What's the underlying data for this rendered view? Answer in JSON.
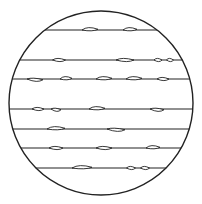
{
  "diagram": {
    "title": "",
    "colors": {
      "stroke": "#222222",
      "background": "#ffffff"
    },
    "circle": {
      "cx": 101,
      "cy": 103,
      "r": 92
    },
    "fibers": [
      {
        "y": 30,
        "nodes": [
          {
            "x": 90,
            "w": 16,
            "tilt": 1
          },
          {
            "x": 130,
            "w": 14,
            "tilt": 1
          }
        ]
      },
      {
        "y": 60,
        "nodes": [
          {
            "x": 59,
            "w": 13,
            "tilt": 0
          },
          {
            "x": 125,
            "w": 18,
            "tilt": 0
          },
          {
            "x": 158,
            "w": 8,
            "tilt": 0
          },
          {
            "x": 170,
            "w": 7,
            "tilt": 0
          }
        ]
      },
      {
        "y": 79,
        "nodes": [
          {
            "x": 35,
            "w": 16,
            "tilt": -1
          },
          {
            "x": 66,
            "w": 12,
            "tilt": 1
          },
          {
            "x": 104,
            "w": 16,
            "tilt": 1
          },
          {
            "x": 134,
            "w": 16,
            "tilt": 1
          },
          {
            "x": 163,
            "w": 12,
            "tilt": 0
          }
        ]
      },
      {
        "y": 109,
        "nodes": [
          {
            "x": 38,
            "w": 12,
            "tilt": 0
          },
          {
            "x": 56,
            "w": 10,
            "tilt": -1
          },
          {
            "x": 97,
            "w": 16,
            "tilt": 1
          },
          {
            "x": 157,
            "w": 14,
            "tilt": -1
          }
        ]
      },
      {
        "y": 129,
        "nodes": [
          {
            "x": 56,
            "w": 18,
            "tilt": 1
          },
          {
            "x": 116,
            "w": 18,
            "tilt": -1
          }
        ]
      },
      {
        "y": 148,
        "nodes": [
          {
            "x": 56,
            "w": 14,
            "tilt": 0
          },
          {
            "x": 104,
            "w": 16,
            "tilt": 0
          },
          {
            "x": 153,
            "w": 14,
            "tilt": 1
          }
        ]
      },
      {
        "y": 168,
        "nodes": [
          {
            "x": 82,
            "w": 20,
            "tilt": 1
          },
          {
            "x": 131,
            "w": 9,
            "tilt": 0
          },
          {
            "x": 145,
            "w": 9,
            "tilt": 0
          }
        ]
      }
    ]
  }
}
